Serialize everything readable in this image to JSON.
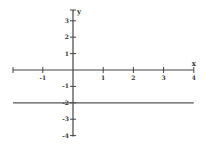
{
  "chart_data": {
    "type": "line",
    "title": "",
    "xlabel": "x",
    "ylabel": "y",
    "xlim": [
      -1.9,
      4
    ],
    "ylim": [
      -4,
      3.4
    ],
    "grid": false,
    "x_ticks": [
      -1,
      1,
      2,
      3,
      4
    ],
    "y_ticks": [
      3,
      2,
      1,
      -1,
      -2,
      -3,
      -4
    ],
    "x_tick_labels": [
      "-1",
      "1",
      "2",
      "3",
      "4"
    ],
    "y_tick_labels": [
      "3",
      "2",
      "1",
      "-1",
      "-2",
      "-3",
      "-4"
    ],
    "series": [
      {
        "name": "y = -2",
        "x": [
          -1.9,
          4
        ],
        "y": [
          -2,
          -2
        ]
      }
    ],
    "colors": {
      "axis": "#444444",
      "line": "#555555"
    }
  }
}
